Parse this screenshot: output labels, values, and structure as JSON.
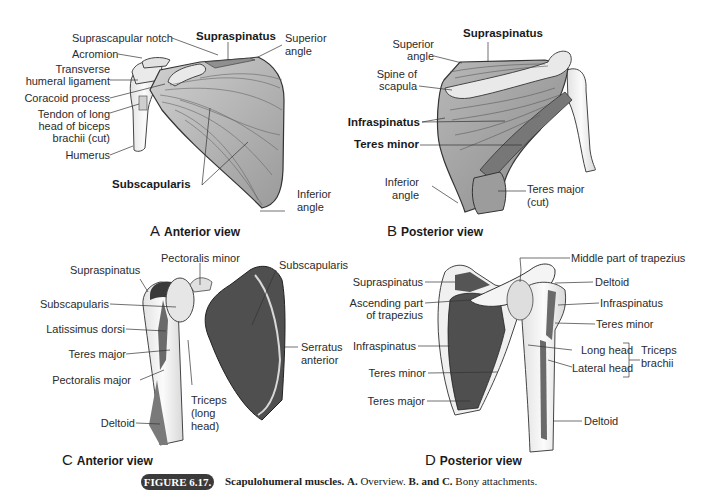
{
  "figure": {
    "badge": "FIGURE 6.17.",
    "caption_title": "Scapulohumeral muscles.",
    "caption_a_bold": "A.",
    "caption_a_text": "Overview.",
    "caption_bc_bold": "B. and C.",
    "caption_bc_text": "Bony attachments."
  },
  "panels": {
    "A": {
      "letter": "A",
      "title": "Anterior view",
      "labels": {
        "suprascapular_notch": "Suprascapular notch",
        "supraspinatus": "Supraspinatus",
        "superior_angle_1": "Superior",
        "superior_angle_2": "angle",
        "acromion": "Acromion",
        "transverse_1": "Transverse",
        "transverse_2": "humeral ligament",
        "coracoid": "Coracoid process",
        "tendon_1": "Tendon of long",
        "tendon_2": "head of biceps",
        "tendon_3": "brachii (cut)",
        "humerus": "Humerus",
        "subscapularis": "Subscapularis",
        "inferior_angle_1": "Inferior",
        "inferior_angle_2": "angle"
      }
    },
    "B": {
      "letter": "B",
      "title": "Posterior view",
      "labels": {
        "supraspinatus": "Supraspinatus",
        "superior_angle_1": "Superior",
        "superior_angle_2": "angle",
        "spine_1": "Spine of",
        "spine_2": "scapula",
        "infraspinatus": "Infraspinatus",
        "teres_minor": "Teres minor",
        "inferior_angle_1": "Inferior",
        "inferior_angle_2": "angle",
        "teres_major_1": "Teres major",
        "teres_major_2": "(cut)"
      }
    },
    "C": {
      "letter": "C",
      "title": "Anterior view",
      "labels": {
        "pectoralis_minor": "Pectoralis minor",
        "supraspinatus": "Supraspinatus",
        "subscapularis_right": "Subscapularis",
        "subscapularis_left": "Subscapularis",
        "latissimus": "Latissimus dorsi",
        "teres_major": "Teres major",
        "pectoralis_major": "Pectoralis major",
        "serratus_1": "Serratus",
        "serratus_2": "anterior",
        "triceps_1": "Triceps",
        "triceps_2": "(long",
        "triceps_3": "head)",
        "deltoid": "Deltoid"
      }
    },
    "D": {
      "letter": "D",
      "title": "Posterior view",
      "labels": {
        "middle_trapezius": "Middle part of trapezius",
        "supraspinatus": "Supraspinatus",
        "deltoid_top": "Deltoid",
        "ascending_1": "Ascending part",
        "ascending_2": "of trapezius",
        "infraspinatus_right": "Infraspinatus",
        "teres_minor_right": "Teres minor",
        "infraspinatus_left": "Infraspinatus",
        "long_head": "Long head",
        "lateral_head": "Lateral head",
        "triceps_1": "Triceps",
        "triceps_2": "brachii",
        "teres_minor_left": "Teres minor",
        "teres_major": "Teres major",
        "deltoid_bottom": "Deltoid"
      }
    }
  },
  "colors": {
    "bone": "#f1f1f1",
    "muscle_light": "#bdbdbd",
    "muscle_mid": "#8e8e8e",
    "attachment_dark": "#5a5a5a",
    "outline": "#2a2a2a",
    "badge_bg": "#3a3a3a"
  }
}
